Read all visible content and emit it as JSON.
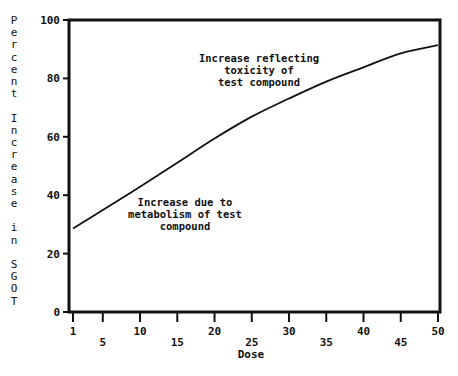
{
  "chart_data": {
    "type": "line",
    "title": "",
    "xlabel": "Dose",
    "ylabel": "Percent Increase in SGOT",
    "xlim": [
      1,
      50
    ],
    "ylim": [
      0,
      100
    ],
    "grid": false,
    "legend": null,
    "x_ticks_row1": [
      1,
      10,
      20,
      30,
      40,
      50
    ],
    "x_ticks_row2": [
      5,
      15,
      25,
      35,
      45
    ],
    "y_ticks": [
      0,
      20,
      40,
      60,
      80,
      100
    ],
    "series": [
      {
        "name": "Percent Increase in SGOT",
        "x": [
          1,
          5,
          10,
          15,
          20,
          25,
          30,
          35,
          40,
          45,
          50
        ],
        "values": [
          28.6,
          34.9,
          42.9,
          51.1,
          59.4,
          66.9,
          73.1,
          78.9,
          83.8,
          88.6,
          91.4
        ]
      }
    ],
    "annotations": [
      {
        "lines": [
          "Increase reflecting",
          "toxicity of",
          "test compound"
        ],
        "x": 28,
        "y": 87
      },
      {
        "lines": [
          "Increase due to",
          "metabolism of test",
          "compound"
        ],
        "x": 16,
        "y": 38
      }
    ]
  }
}
